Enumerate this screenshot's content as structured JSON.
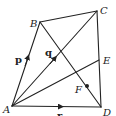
{
  "diagram": {
    "type": "geometry",
    "points": {
      "A": {
        "label": "A",
        "x": 12,
        "y": 106
      },
      "B": {
        "label": "B",
        "x": 40,
        "y": 22
      },
      "C": {
        "label": "C",
        "x": 97,
        "y": 11
      },
      "D": {
        "label": "D",
        "x": 101,
        "y": 107
      },
      "E": {
        "label": "E",
        "x": 99,
        "y": 60
      },
      "F": {
        "label": "F",
        "x": 87,
        "y": 86
      }
    },
    "segments": [
      {
        "from": "A",
        "to": "B",
        "vector": "p"
      },
      {
        "from": "B",
        "to": "C"
      },
      {
        "from": "C",
        "to": "D"
      },
      {
        "from": "A",
        "to": "D",
        "vector": "r"
      },
      {
        "from": "A",
        "to": "C",
        "vector": "q"
      },
      {
        "from": "B",
        "to": "D"
      },
      {
        "from": "A",
        "to": "E"
      }
    ],
    "vectors": {
      "p": {
        "label": "p"
      },
      "q": {
        "label": "q"
      },
      "r": {
        "label": "r"
      }
    },
    "colors": {
      "line": "#222222",
      "background": "#ffffff"
    }
  }
}
